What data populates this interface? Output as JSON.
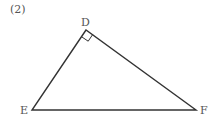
{
  "problem_label": "(2)",
  "vertices": {
    "D": {
      "label": "D",
      "x": 86,
      "y": 30
    },
    "E": {
      "label": "E",
      "x": 32,
      "y": 110
    },
    "F": {
      "label": "F",
      "x": 196,
      "y": 110
    }
  },
  "right_angle_at": "D",
  "colors": {
    "stroke": "#333333",
    "text": "#555555"
  }
}
